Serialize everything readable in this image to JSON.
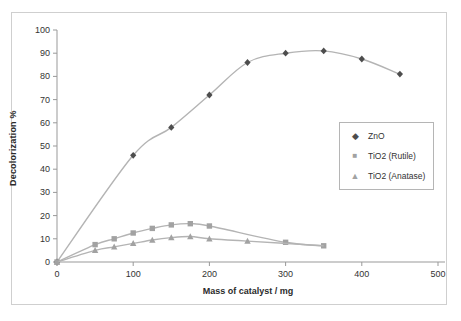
{
  "figure": {
    "background": "#ffffff",
    "frame_border_color": "#cfcfcf",
    "axis_color": "#999999",
    "tick_label_color": "#333333"
  },
  "chart_data": {
    "type": "scatter",
    "title": "",
    "xlabel": "Mass of catalyst / mg",
    "ylabel": "Decolorization %",
    "xlim": [
      0,
      500
    ],
    "ylim": [
      0,
      100
    ],
    "x_ticks": [
      0,
      100,
      200,
      300,
      400,
      500
    ],
    "y_ticks": [
      0,
      10,
      20,
      30,
      40,
      50,
      60,
      70,
      80,
      90,
      100
    ],
    "grid": "off",
    "legend_position": "middle-right",
    "line_color": "#b4b4b4",
    "series": [
      {
        "name": "ZnO",
        "marker": "diamond",
        "marker_color": "#4d4d4d",
        "points": [
          [
            0,
            0
          ],
          [
            100,
            46
          ],
          [
            150,
            58
          ],
          [
            200,
            72
          ],
          [
            250,
            86
          ],
          [
            300,
            90
          ],
          [
            350,
            91
          ],
          [
            400,
            87.5
          ],
          [
            450,
            81
          ]
        ]
      },
      {
        "name": "TiO2 (Rutile)",
        "marker": "square",
        "marker_color": "#a2a2a2",
        "points": [
          [
            0,
            0
          ],
          [
            50,
            7.5
          ],
          [
            75,
            10
          ],
          [
            100,
            12.5
          ],
          [
            125,
            14.5
          ],
          [
            150,
            16
          ],
          [
            175,
            16.5
          ],
          [
            200,
            15.5
          ],
          [
            300,
            8.5
          ],
          [
            350,
            7
          ]
        ]
      },
      {
        "name": "TiO2 (Anatase)",
        "marker": "triangle",
        "marker_color": "#a2a2a2",
        "points": [
          [
            0,
            0
          ],
          [
            50,
            5
          ],
          [
            75,
            6.5
          ],
          [
            100,
            8
          ],
          [
            125,
            9.5
          ],
          [
            150,
            10.5
          ],
          [
            175,
            11
          ],
          [
            200,
            10
          ],
          [
            250,
            9
          ]
        ],
        "line_extension": [
          [
            350,
            7
          ]
        ]
      }
    ]
  }
}
